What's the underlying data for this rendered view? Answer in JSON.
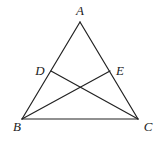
{
  "diagram": {
    "title": "",
    "points": {
      "A": {
        "label": "A",
        "x": 80,
        "y": 22,
        "lx": 80,
        "ly": 15
      },
      "B": {
        "label": "B",
        "x": 22,
        "y": 119,
        "lx": 17,
        "ly": 131
      },
      "C": {
        "label": "C",
        "x": 138,
        "y": 119,
        "lx": 148,
        "ly": 131
      },
      "D": {
        "label": "D",
        "x": 51,
        "y": 71,
        "lx": 40,
        "ly": 75
      },
      "E": {
        "label": "E",
        "x": 110,
        "y": 71,
        "lx": 120,
        "ly": 75
      }
    },
    "segments": [
      {
        "name": "AB",
        "from": "A",
        "to": "B"
      },
      {
        "name": "AC",
        "from": "A",
        "to": "C"
      },
      {
        "name": "BC",
        "from": "B",
        "to": "C"
      },
      {
        "name": "BE",
        "from": "B",
        "to": "E"
      },
      {
        "name": "CD",
        "from": "C",
        "to": "D"
      }
    ],
    "line_color": "#222222"
  }
}
